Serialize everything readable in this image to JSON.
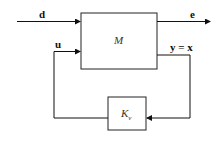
{
  "diagram": {
    "blocks": {
      "plant": "M",
      "controller": "K",
      "controller_sub": "v"
    },
    "signals": {
      "d": "d",
      "e": "e",
      "u": "u",
      "y": "y = x"
    }
  }
}
